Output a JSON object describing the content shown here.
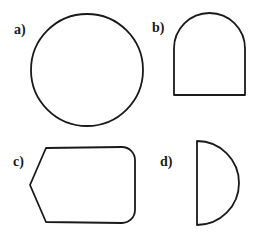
{
  "figure": {
    "background_color": "#ffffff",
    "stroke_color": "#1a1a1a",
    "stroke_width": 1.8,
    "width": 257,
    "height": 235,
    "shapes": [
      {
        "label": "a)",
        "name": "circle",
        "description": "circle",
        "label_x": 14,
        "label_y": 23,
        "geometry": {
          "type": "circle",
          "cx": 87,
          "cy": 70,
          "r": 56
        }
      },
      {
        "label": "b)",
        "name": "arch",
        "description": "rectangle with semicircular top (arch)",
        "label_x": 152,
        "label_y": 21,
        "geometry": {
          "type": "arch",
          "x_left": 174,
          "x_right": 245,
          "y_top": 13,
          "y_bottom": 95,
          "arc_radius": 35.5
        }
      },
      {
        "label": "c)",
        "name": "pointed-rounded-hexagon",
        "description": "shape with pointed left vertex, flat top and bottom, rounded right end",
        "label_x": 13,
        "label_y": 155,
        "geometry": {
          "type": "polygon-rounded",
          "apex_x": 30,
          "apex_y": 185,
          "x_top_left": 47,
          "x_right": 135,
          "y_top": 147,
          "y_bottom": 223,
          "corner_radius": 13
        }
      },
      {
        "label": "d)",
        "name": "semicircle",
        "description": "half circle with flat vertical left edge",
        "label_x": 160,
        "label_y": 155,
        "geometry": {
          "type": "semicircle",
          "x_flat": 197,
          "y_top": 141,
          "y_bottom": 225,
          "r": 42
        }
      }
    ]
  }
}
